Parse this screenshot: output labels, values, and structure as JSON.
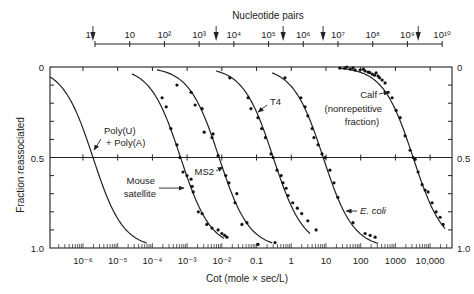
{
  "chart_data": {
    "type": "line",
    "title": "",
    "xlabel": "Cot (mole × sec/L)",
    "ylabel": "Fraction reassociated",
    "x_scale": "log",
    "xlim_log10": [
      -6.95,
      4.63
    ],
    "ylim": [
      0,
      1.0
    ],
    "y_inverted": true,
    "grid": false,
    "legend": "none (curves labeled directly)",
    "reference_line_y": 0.5,
    "xticks_log10": [
      -6,
      -5,
      -4,
      -3,
      -2,
      -1,
      0,
      1,
      2,
      3,
      4
    ],
    "xtick_labels": [
      "10⁻⁶",
      "10⁻⁵",
      "10⁻⁴",
      "10⁻³",
      "10⁻²",
      "0.1",
      "1",
      "10",
      "100",
      "1000",
      "10,000"
    ],
    "yticks": [
      0,
      0.5,
      1.0
    ],
    "ytick_labels": [
      "0",
      "0.5",
      "1.0"
    ],
    "y_minor_step": 0.1,
    "secondary_x_axis": {
      "label": "Nucleotide pairs",
      "cot_log10_at_1bp": -5.654,
      "ticks_log10": [
        0,
        1,
        2,
        3,
        4,
        5,
        6,
        7,
        8,
        9,
        10
      ],
      "tick_labels": [
        "1",
        "10",
        "10²",
        "10³",
        "10⁴",
        "10⁵",
        "10⁶",
        "10⁷",
        "10⁸",
        "10⁹",
        "10¹⁰"
      ],
      "label_positions_log10": [
        -0.2,
        1,
        2,
        3,
        4,
        5,
        6,
        7,
        8,
        9,
        10
      ],
      "marker_arrows_log10": [
        -0.06,
        3.49,
        5.42,
        6.57,
        9.31
      ]
    },
    "series": [
      {
        "name": "Poly(U) + Poly(A)",
        "cot_half": 1.94e-06,
        "fit_range_log10": [
          -6.95,
          -4.16
        ],
        "points": []
      },
      {
        "name": "Mouse satellite",
        "cot_half": 0.000646,
        "fit_range_log10": [
          -4.59,
          -1.94
        ],
        "points": [
          [
            0.00019,
            0.17
          ],
          [
            0.00025,
            0.22
          ],
          [
            0.00034,
            0.34
          ],
          [
            0.00051,
            0.43
          ],
          [
            0.00062,
            0.5
          ],
          [
            0.00076,
            0.58
          ],
          [
            0.00099,
            0.6
          ],
          [
            0.0013,
            0.62
          ],
          [
            0.0014,
            0.66
          ],
          [
            0.0015,
            0.69
          ],
          [
            0.0021,
            0.8
          ],
          [
            0.0027,
            0.81
          ],
          [
            0.0037,
            0.87
          ],
          [
            0.0052,
            0.89
          ],
          [
            0.0078,
            0.9
          ],
          [
            0.01,
            0.92
          ],
          [
            0.012,
            0.93
          ],
          [
            0.014,
            0.94
          ]
        ]
      },
      {
        "name": "MS2",
        "cot_half": 0.00832,
        "fit_range_log10": [
          -3.87,
          -0.55
        ],
        "points": [
          [
            0.00051,
            0.1
          ],
          [
            0.0013,
            0.14
          ],
          [
            0.0017,
            0.21
          ],
          [
            0.0027,
            0.23
          ],
          [
            0.0031,
            0.36
          ],
          [
            0.0056,
            0.37
          ],
          [
            0.0052,
            0.39
          ],
          [
            0.0078,
            0.49
          ],
          [
            0.013,
            0.6
          ],
          [
            0.016,
            0.64
          ],
          [
            0.027,
            0.7
          ],
          [
            0.024,
            0.75
          ],
          [
            0.038,
            0.87
          ],
          [
            0.053,
            0.86
          ],
          [
            0.11,
            0.98
          ],
          [
            0.34,
            0.97
          ]
        ]
      },
      {
        "name": "T4",
        "cot_half": 0.302,
        "fit_range_log10": [
          -2.17,
          0.54
        ],
        "points": [
          [
            0.017,
            0.06
          ],
          [
            0.057,
            0.17
          ],
          [
            0.069,
            0.23
          ],
          [
            0.11,
            0.28
          ],
          [
            0.14,
            0.34
          ],
          [
            0.18,
            0.39
          ],
          [
            0.26,
            0.48
          ],
          [
            0.3,
            0.5
          ],
          [
            0.39,
            0.57
          ],
          [
            0.51,
            0.6
          ],
          [
            0.58,
            0.64
          ],
          [
            0.71,
            0.67
          ],
          [
            0.81,
            0.71
          ],
          [
            1.1,
            0.75
          ],
          [
            1.5,
            0.78
          ],
          [
            2.0,
            0.81
          ],
          [
            3.0,
            0.85
          ],
          [
            5.2,
            0.9
          ]
        ]
      },
      {
        "name": "E. coli",
        "cot_half": 8.32,
        "fit_range_log10": [
          -0.55,
          2.5
        ],
        "points": [
          [
            0.66,
            0.06
          ],
          [
            1.9,
            0.17
          ],
          [
            2.5,
            0.22
          ],
          [
            3.0,
            0.27
          ],
          [
            4.0,
            0.34
          ],
          [
            4.5,
            0.39
          ],
          [
            5.9,
            0.43
          ],
          [
            7.7,
            0.48
          ],
          [
            9.4,
            0.5
          ],
          [
            13,
            0.57
          ],
          [
            17,
            0.64
          ],
          [
            22,
            0.72
          ],
          [
            60,
            0.86
          ],
          [
            134,
            0.92
          ],
          [
            187,
            0.93
          ],
          [
            260,
            0.94
          ]
        ]
      },
      {
        "name": "Calf (nonrepetitive fraction)",
        "cot_half": 3236,
        "fit_range_log10": [
          1.37,
          4.43
        ],
        "points": [
          [
            25,
            0.006
          ],
          [
            35,
            0.006
          ],
          [
            40,
            0.0
          ],
          [
            50,
            0.011
          ],
          [
            60,
            0.005
          ],
          [
            69,
            0.017
          ],
          [
            96,
            0.017
          ],
          [
            120,
            0.012
          ],
          [
            134,
            0.022
          ],
          [
            163,
            0.028
          ],
          [
            180,
            0.03
          ],
          [
            213,
            0.039
          ],
          [
            250,
            0.045
          ],
          [
            278,
            0.033
          ],
          [
            317,
            0.05
          ],
          [
            350,
            0.06
          ],
          [
            414,
            0.072
          ],
          [
            505,
            0.088
          ],
          [
            617,
            0.14
          ],
          [
            803,
            0.17
          ],
          [
            1050,
            0.24
          ],
          [
            1370,
            0.28
          ],
          [
            1900,
            0.38
          ],
          [
            2660,
            0.46
          ],
          [
            3240,
            0.5
          ],
          [
            3700,
            0.51
          ],
          [
            4500,
            0.58
          ],
          [
            5880,
            0.65
          ],
          [
            7180,
            0.68
          ],
          [
            8750,
            0.69
          ],
          [
            11400,
            0.75
          ],
          [
            14900,
            0.8
          ],
          [
            19400,
            0.83
          ],
          [
            23700,
            0.87
          ]
        ]
      }
    ],
    "annotations": [
      {
        "target": "Poly(U) + Poly(A)",
        "lines": [
          {
            "text": "Poly(U)",
            "at": [
              -5.395,
              0.37
            ],
            "anchor": "start"
          },
          {
            "text": "+ Poly(A)",
            "at": [
              -5.337,
              0.436
            ],
            "anchor": "start"
          }
        ],
        "arrow": {
          "from": [
            -5.481,
            0.398
          ],
          "to": [
            -5.683,
            0.459
          ]
        }
      },
      {
        "target": "Mouse satellite",
        "lines": [
          {
            "text": "Mouse",
            "at": [
              -3.925,
              0.646
            ],
            "anchor": "end"
          },
          {
            "text": "satellite",
            "at": [
              -3.896,
              0.718
            ],
            "anchor": "end"
          }
        ],
        "arrow": {
          "from": [
            -3.81,
            0.669
          ],
          "to": [
            -3.089,
            0.669
          ]
        }
      },
      {
        "target": "MS2",
        "lines": [
          {
            "text": "MS2",
            "at": [
              -2.225,
              0.597
            ],
            "anchor": "end"
          }
        ],
        "arrow": {
          "from": [
            -2.167,
            0.575
          ],
          "to": [
            -1.965,
            0.552
          ]
        }
      },
      {
        "target": "T4",
        "lines": [
          {
            "text": "T4",
            "at": [
              -0.611,
              0.21
            ],
            "anchor": "start"
          }
        ],
        "arrow": {
          "from": [
            -0.697,
            0.21
          ],
          "to": [
            -0.957,
            0.249
          ]
        }
      },
      {
        "target": "E. coli",
        "italic": true,
        "lines": [
          {
            "text": "E. coli",
            "at": [
              1.983,
              0.812
            ],
            "anchor": "start"
          }
        ],
        "arrow": {
          "from": [
            1.896,
            0.796
          ],
          "to": [
            1.579,
            0.796
          ]
        }
      },
      {
        "target": "Calf (nonrepetitive fraction)",
        "lines": [
          {
            "text": "Calf",
            "at": [
              2.473,
              0.171
            ],
            "anchor": "end"
          },
          {
            "text": "(nonrepetitive",
            "at": [
              2.617,
              0.249
            ],
            "anchor": "end"
          },
          {
            "text": "fraction)",
            "at": [
              2.53,
              0.32
            ],
            "anchor": "end"
          }
        ],
        "arrow": {
          "from": [
            2.53,
            0.149
          ],
          "to": [
            2.818,
            0.138
          ]
        }
      }
    ]
  }
}
